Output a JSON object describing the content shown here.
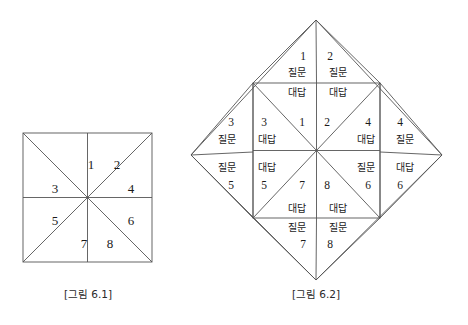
{
  "page": {
    "background": "#ffffff",
    "line_color": "#555555",
    "text_color": "#1a1a1a"
  },
  "figure1": {
    "caption": "[그림 6.1]",
    "shape": "square-with-diagonals-and-medians",
    "sectors": [
      {
        "id": "s1",
        "number": "1",
        "x": 91,
        "y": 164
      },
      {
        "id": "s2",
        "number": "2",
        "x": 117,
        "y": 164
      },
      {
        "id": "s3",
        "number": "3",
        "x": 55,
        "y": 188
      },
      {
        "id": "s4",
        "number": "4",
        "x": 131,
        "y": 188
      },
      {
        "id": "s5",
        "number": "5",
        "x": 55,
        "y": 220
      },
      {
        "id": "s6",
        "number": "6",
        "x": 131,
        "y": 220
      },
      {
        "id": "s7",
        "number": "7",
        "x": 84,
        "y": 243
      },
      {
        "id": "s8",
        "number": "8",
        "x": 110,
        "y": 243
      }
    ],
    "caption_pos": {
      "x": 88,
      "y": 292
    }
  },
  "figure2": {
    "caption": "[그림 6.2]",
    "shape": "diamond-with-inscribed-square",
    "word_question": "질문",
    "word_answer": "대답",
    "labels": [
      {
        "id": "t1-num",
        "kind": "number",
        "text": "1",
        "x": 303,
        "y": 57
      },
      {
        "id": "t1-q",
        "kind": "word",
        "text": "질문",
        "x": 297,
        "y": 73
      },
      {
        "id": "t1-a",
        "kind": "word",
        "text": "대답",
        "x": 297,
        "y": 93
      },
      {
        "id": "t2-num",
        "kind": "number",
        "text": "2",
        "x": 330,
        "y": 57
      },
      {
        "id": "t2-q",
        "kind": "word",
        "text": "질문",
        "x": 338,
        "y": 73
      },
      {
        "id": "t2-a",
        "kind": "word",
        "text": "대답",
        "x": 338,
        "y": 93
      },
      {
        "id": "l3o-num",
        "kind": "number",
        "text": "3",
        "x": 231,
        "y": 123
      },
      {
        "id": "l3o-q",
        "kind": "word",
        "text": "질문",
        "x": 227,
        "y": 140
      },
      {
        "id": "l3i-num",
        "kind": "number",
        "text": "3",
        "x": 264,
        "y": 123
      },
      {
        "id": "l3i-a",
        "kind": "word",
        "text": "대답",
        "x": 267,
        "y": 140
      },
      {
        "id": "c1",
        "kind": "number",
        "text": "1",
        "x": 302,
        "y": 123
      },
      {
        "id": "c2",
        "kind": "number",
        "text": "2",
        "x": 327,
        "y": 123
      },
      {
        "id": "r4i-num",
        "kind": "number",
        "text": "4",
        "x": 368,
        "y": 123
      },
      {
        "id": "r4i-a",
        "kind": "word",
        "text": "대답",
        "x": 366,
        "y": 140
      },
      {
        "id": "r4o-num",
        "kind": "number",
        "text": "4",
        "x": 400,
        "y": 123
      },
      {
        "id": "r4o-q",
        "kind": "word",
        "text": "질문",
        "x": 405,
        "y": 140
      },
      {
        "id": "l5o-q",
        "kind": "word",
        "text": "질문",
        "x": 227,
        "y": 168
      },
      {
        "id": "l5o-num",
        "kind": "number",
        "text": "5",
        "x": 231,
        "y": 186
      },
      {
        "id": "l5i-a",
        "kind": "word",
        "text": "대답",
        "x": 267,
        "y": 168
      },
      {
        "id": "l5i-num",
        "kind": "number",
        "text": "5",
        "x": 264,
        "y": 186
      },
      {
        "id": "c7",
        "kind": "number",
        "text": "7",
        "x": 302,
        "y": 186
      },
      {
        "id": "c8",
        "kind": "number",
        "text": "8",
        "x": 327,
        "y": 186
      },
      {
        "id": "r6i-q",
        "kind": "word",
        "text": "질문",
        "x": 366,
        "y": 168
      },
      {
        "id": "r6i-num",
        "kind": "number",
        "text": "6",
        "x": 368,
        "y": 186
      },
      {
        "id": "r6o-a",
        "kind": "word",
        "text": "대답",
        "x": 405,
        "y": 168
      },
      {
        "id": "r6o-num",
        "kind": "number",
        "text": "6",
        "x": 400,
        "y": 186
      },
      {
        "id": "b7-a",
        "kind": "word",
        "text": "대답",
        "x": 297,
        "y": 209
      },
      {
        "id": "b7-q",
        "kind": "word",
        "text": "질문",
        "x": 297,
        "y": 228
      },
      {
        "id": "b7-num",
        "kind": "number",
        "text": "7",
        "x": 303,
        "y": 245
      },
      {
        "id": "b8-a",
        "kind": "word",
        "text": "대답",
        "x": 338,
        "y": 209
      },
      {
        "id": "b8-q",
        "kind": "word",
        "text": "질문",
        "x": 338,
        "y": 228
      },
      {
        "id": "b8-num",
        "kind": "number",
        "text": "8",
        "x": 330,
        "y": 245
      }
    ],
    "caption_pos": {
      "x": 316,
      "y": 292
    }
  }
}
